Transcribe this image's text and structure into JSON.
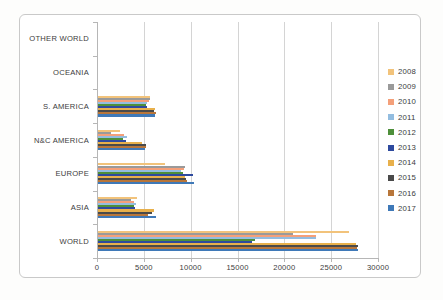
{
  "chart_data": {
    "type": "bar",
    "orientation": "horizontal",
    "title": "",
    "xlabel": "",
    "ylabel": "",
    "xlim": [
      0,
      30000
    ],
    "xticks": [
      0,
      5000,
      10000,
      15000,
      20000,
      25000,
      30000
    ],
    "xtick_labels": [
      "0",
      "5000",
      "10000",
      "15000",
      "20000",
      "25000",
      "30000"
    ],
    "grid": "vertical",
    "legend_position": "right",
    "categories": [
      "OTHER WORLD",
      "OCEANIA",
      "S. AMERICA",
      "N&C AMERICA",
      "EUROPE",
      "ASIA",
      "WORLD"
    ],
    "series": [
      {
        "name": "2008",
        "color": "#f2c37b",
        "values": [
          0,
          0,
          5650,
          2450,
          7250,
          4300,
          26900
        ]
      },
      {
        "name": "2009",
        "color": "#9a9a9a",
        "values": [
          0,
          0,
          5700,
          1500,
          9350,
          3600,
          20900
        ]
      },
      {
        "name": "2010",
        "color": "#f4a07a",
        "values": [
          0,
          0,
          5500,
          2900,
          9300,
          3900,
          23400
        ]
      },
      {
        "name": "2011",
        "color": "#93bde0",
        "values": [
          0,
          0,
          5300,
          3200,
          9000,
          4200,
          23350
        ]
      },
      {
        "name": "2012",
        "color": "#4e8f3a",
        "values": [
          0,
          0,
          5250,
          2750,
          9150,
          3950,
          16900
        ]
      },
      {
        "name": "2013",
        "color": "#2e4a9e",
        "values": [
          0,
          0,
          5350,
          3050,
          10300,
          4050,
          16600
        ]
      },
      {
        "name": "2014",
        "color": "#e8b04b",
        "values": [
          0,
          0,
          6150,
          4850,
          9350,
          6100,
          27700
        ]
      },
      {
        "name": "2015",
        "color": "#4a4a4a",
        "values": [
          0,
          0,
          6050,
          5200,
          9500,
          5900,
          27850
        ]
      },
      {
        "name": "2016",
        "color": "#b8763a",
        "values": [
          0,
          0,
          6300,
          5250,
          9600,
          5450,
          27750
        ]
      },
      {
        "name": "2017",
        "color": "#3f79b8",
        "values": [
          0,
          0,
          6200,
          5100,
          10350,
          6350,
          27900
        ]
      }
    ]
  }
}
